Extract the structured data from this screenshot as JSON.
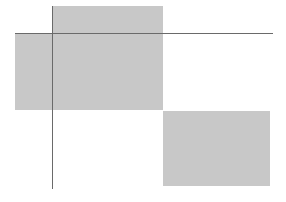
{
  "canvas": {
    "width": 286,
    "height": 202,
    "background": "#ffffff"
  },
  "colors": {
    "fill": "#c8c8c8",
    "line": "#6a6a6a"
  },
  "rects": [
    {
      "id": "top",
      "x": 52,
      "y": 6,
      "w": 111,
      "h": 28
    },
    {
      "id": "left-middle",
      "x": 15,
      "y": 33,
      "w": 148,
      "h": 77
    },
    {
      "id": "bottom-right",
      "x": 163,
      "y": 111,
      "w": 107,
      "h": 75
    }
  ],
  "lines": [
    {
      "id": "horizontal",
      "x": 15,
      "y": 33,
      "w": 258,
      "h": 1
    },
    {
      "id": "vertical",
      "x": 52,
      "y": 6,
      "w": 1,
      "h": 183
    }
  ]
}
